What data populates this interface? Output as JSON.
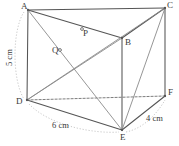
{
  "figure": {
    "type": "geometry-diagram",
    "canvas": {
      "width": 179,
      "height": 146
    },
    "colors": {
      "background": "#ffffff",
      "stroke": "#555555",
      "stroke_light": "#8a8a8a",
      "dashed": "#6e6e6e",
      "dotted_measure": "#c9c9c9",
      "text": "#3a3a3a"
    },
    "vertex_labels": [
      {
        "id": "A",
        "text": "A",
        "x": 21,
        "y": 2,
        "px": 28,
        "py": 10
      },
      {
        "id": "C",
        "text": "C",
        "x": 167,
        "y": 1,
        "px": 165,
        "py": 8
      },
      {
        "id": "P",
        "text": "P",
        "x": 83,
        "y": 29,
        "px": 82,
        "py": 29
      },
      {
        "id": "B",
        "text": "B",
        "x": 125,
        "y": 38,
        "px": 122,
        "py": 38
      },
      {
        "id": "Q",
        "text": "Q",
        "x": 52,
        "y": 46,
        "px": 60,
        "py": 50
      },
      {
        "id": "D",
        "text": "D",
        "x": 16,
        "y": 97,
        "px": 27,
        "py": 100
      },
      {
        "id": "F",
        "text": "F",
        "x": 168,
        "y": 88,
        "px": 165,
        "py": 96
      },
      {
        "id": "E",
        "text": "E",
        "x": 120,
        "y": 133,
        "px": 122,
        "py": 130
      }
    ],
    "measure_labels": [
      {
        "id": "AD",
        "text": "5 cm",
        "x": 4,
        "y": 44,
        "rotated": true
      },
      {
        "id": "DE",
        "text": "6 cm",
        "x": 52,
        "y": 121,
        "rotated": false
      },
      {
        "id": "EF",
        "text": "4 cm",
        "x": 146,
        "y": 114,
        "rotated": false
      }
    ],
    "edges": [
      {
        "id": "A-C",
        "from": "A",
        "to": "C",
        "style": "solid"
      },
      {
        "id": "A-B",
        "from": "A",
        "to": "B",
        "style": "solid"
      },
      {
        "id": "C-B",
        "from": "C",
        "to": "B",
        "style": "solid"
      },
      {
        "id": "A-D",
        "from": "A",
        "to": "D",
        "style": "solid"
      },
      {
        "id": "C-F",
        "from": "C",
        "to": "F",
        "style": "solid"
      },
      {
        "id": "B-E",
        "from": "B",
        "to": "E",
        "style": "solid"
      },
      {
        "id": "D-E",
        "from": "D",
        "to": "E",
        "style": "solid"
      },
      {
        "id": "E-F",
        "from": "E",
        "to": "F",
        "style": "solid"
      },
      {
        "id": "D-F",
        "from": "D",
        "to": "F",
        "style": "dashed"
      }
    ],
    "diagonals": [
      {
        "id": "A-E",
        "from": "A",
        "to": "E",
        "style": "solid"
      },
      {
        "id": "D-B",
        "from": "D",
        "to": "B",
        "style": "solid"
      },
      {
        "id": "D-C",
        "from": "D",
        "to": "C",
        "style": "solid"
      },
      {
        "id": "C-E",
        "from": "C",
        "to": "E",
        "style": "solid"
      }
    ],
    "measure_arcs": [
      {
        "id": "arc-AD",
        "d": "M 24 12 C 12 30, 12 80, 24 99"
      },
      {
        "id": "arc-DE",
        "d": "M 29 104 C 50 126, 95 134, 119 132"
      },
      {
        "id": "arc-EF",
        "d": "M 126 132 C 145 128, 158 112, 165 100"
      }
    ]
  }
}
